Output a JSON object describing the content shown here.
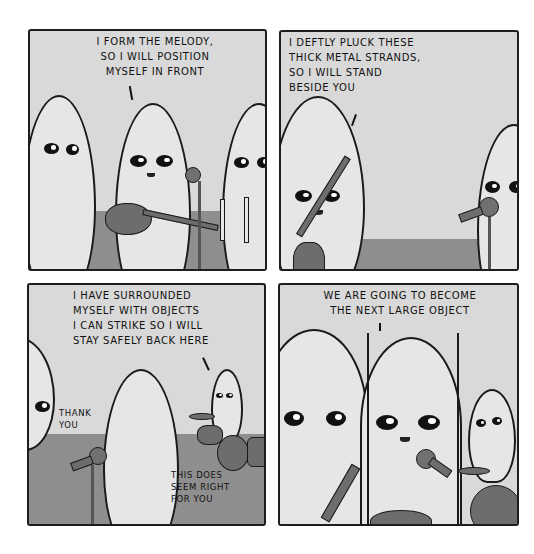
{
  "comic": {
    "colors": {
      "background": "#ffffff",
      "panel_fill": "#d9d9d9",
      "floor": "#8e8e8e",
      "ink": "#1a1a1a",
      "alien_skin": "#e6e6e6",
      "instrument": "#6d6d6d"
    },
    "panels": [
      {
        "id": 1,
        "speech": "I form the melody,\nso I will position\nmyself in front"
      },
      {
        "id": 2,
        "speech": "I deftly pluck these\nthick metal strands,\nso I will stand\nbeside you"
      },
      {
        "id": 3,
        "speech": "I have surrounded\nmyself with objects\nI can strike so I will\nstay safely back here",
        "aside_left": "Thank\nyou",
        "aside_bottom": "This does\nseem right\nfor you"
      },
      {
        "id": 4,
        "speech": "We are going to become\nthe next large object"
      }
    ]
  }
}
